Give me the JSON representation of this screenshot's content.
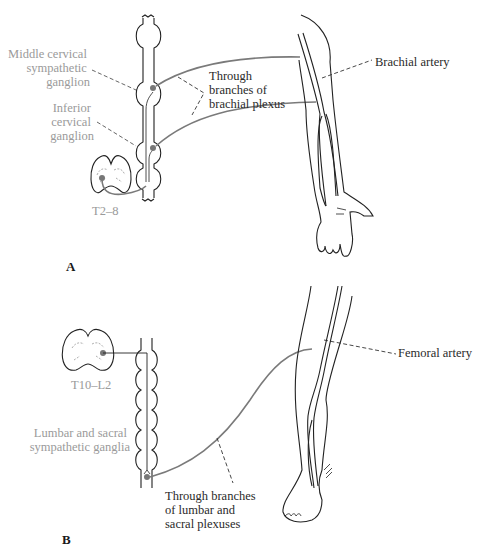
{
  "figure": {
    "panel_a": {
      "letter": "A",
      "labels": {
        "middle_ganglion": [
          "Middle cervical",
          "sympathetic",
          "ganglion"
        ],
        "inferior_ganglion": [
          "Inferior",
          "cervical",
          "ganglion"
        ],
        "spinal_level": "T2–8",
        "through_branches": [
          "Through",
          "branches of",
          "brachial plexus"
        ],
        "artery": "Brachial artery"
      }
    },
    "panel_b": {
      "letter": "B",
      "labels": {
        "spinal_level": "T10–L2",
        "ganglia": [
          "Lumbar and sacral",
          "sympathetic ganglia"
        ],
        "through_branches": [
          "Through branches",
          "of lumbar and",
          "sacral plexuses"
        ],
        "artery": "Femoral artery"
      }
    },
    "colors": {
      "ink": "#2a2a2a",
      "grey_label": "#9a9a9a",
      "nerve": "#7a7a7a"
    }
  }
}
